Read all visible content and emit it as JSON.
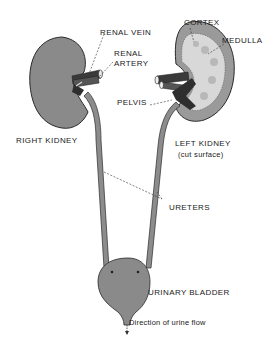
{
  "diagram": {
    "colors": {
      "organ_fill": "#8a8a8a",
      "cortex_fill": "#9a9a9a",
      "medulla_fill": "#d8d8d8",
      "vessel_fill": "#3a3a3a",
      "ureter_fill": "#8c8c8c",
      "outline": "#2a2a2a",
      "background": "#ffffff"
    },
    "labels": {
      "renal_vein": "RENAL VEIN",
      "renal_artery_line1": "RENAL",
      "renal_artery_line2": "ARTERY",
      "cortex": "CORTEX",
      "medulla": "MEDULLA",
      "pelvis": "PELVIS",
      "right_kidney": "RIGHT KIDNEY",
      "left_kidney_line1": "LEFT KIDNEY",
      "left_kidney_line2": "(cut surface)",
      "ureters": "URETERS",
      "urinary_bladder": "URINARY BLADDER",
      "flow_direction": "Direction of urine flow"
    },
    "parts": [
      "right-kidney",
      "left-kidney",
      "renal-vein",
      "renal-artery",
      "cortex",
      "medulla",
      "pelvis",
      "ureters",
      "urinary-bladder",
      "urethra-flow-arrow"
    ]
  }
}
